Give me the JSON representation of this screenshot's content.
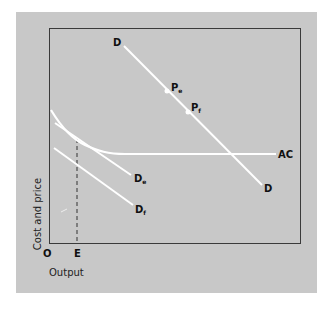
{
  "diagram": {
    "colors": {
      "panel_background": "#c8c8c8",
      "frame": "#3a3a3a",
      "curves": "#ffffff",
      "dashed_line": "#333333",
      "labels": "#111111"
    },
    "axes": {
      "x_label": "Output",
      "y_label": "Cost and price",
      "origin_label": "O",
      "x_marker_label": "E"
    },
    "curves": {
      "ac": {
        "label": "AC"
      },
      "d": {
        "label_start": "D",
        "label_end": "D"
      },
      "de": {
        "label": "D",
        "subscript": "e"
      },
      "df": {
        "label": "D",
        "subscript": "f"
      }
    },
    "points": {
      "pe": {
        "label": "P",
        "subscript": "e"
      },
      "pf": {
        "label": "P",
        "subscript": "f"
      }
    }
  }
}
